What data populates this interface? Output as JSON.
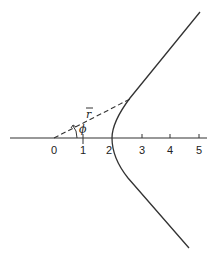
{
  "diagram": {
    "type": "hyperbola-branch",
    "axis": {
      "tick_labels": [
        "0",
        "1",
        "2",
        "3",
        "4",
        "5"
      ]
    },
    "labels": {
      "radius": "r",
      "angle": "ϕ"
    },
    "colors": {
      "stroke": "#333333",
      "background": "#ffffff"
    }
  }
}
